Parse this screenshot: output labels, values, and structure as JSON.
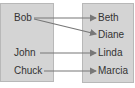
{
  "diagram": {
    "domain_set": {
      "items": [
        "Bob",
        "John",
        "Chuck"
      ]
    },
    "range_set": {
      "items": [
        "Beth",
        "Diane",
        "Linda",
        "Marcia"
      ]
    },
    "mappings": [
      {
        "from": "Bob",
        "to": "Beth"
      },
      {
        "from": "Bob",
        "to": "Diane"
      },
      {
        "from": "John",
        "to": "Linda"
      },
      {
        "from": "Chuck",
        "to": "Marcia"
      }
    ],
    "colors": {
      "box_fill": "#d4d4d4",
      "arrow": "#777777",
      "text": "#333333"
    }
  }
}
